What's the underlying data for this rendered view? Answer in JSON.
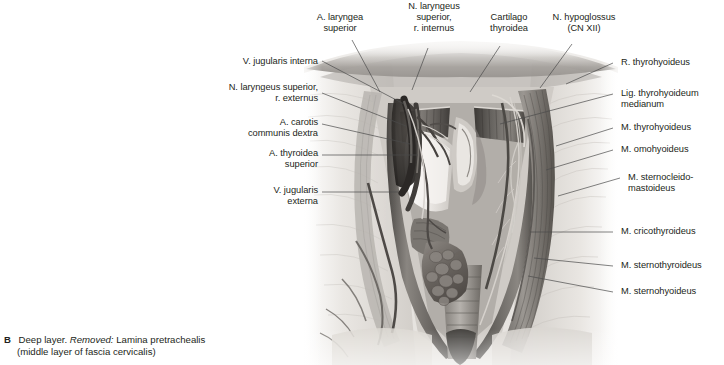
{
  "figure": {
    "panel_letter": "B",
    "caption_lead": "Deep layer.",
    "caption_italic": "Removed:",
    "caption_rest": "Lamina pretrachealis",
    "caption_line2": "(middle layer of fascia cervicalis)"
  },
  "illustration": {
    "alt_name": "anterior-neck-dissection-deep-layer",
    "palette": {
      "ink": "#231f20",
      "leader": "#4a4a4a",
      "muscle_mid": "#8d8a86",
      "muscle_dark": "#4f4c49",
      "fascia_light": "#e3e0dc",
      "vessel_dark": "#3a3735",
      "thyroid": "#6f6a66",
      "background": "#ffffff"
    }
  },
  "labels_top": [
    {
      "id": "a-laryngea-superior",
      "text": "A. laryngea\nsuperior"
    },
    {
      "id": "n-laryngeus-superior-r-internus",
      "text": "N. laryngeus\nsuperior,\nr. internus"
    },
    {
      "id": "cartilago-thyroidea",
      "text": "Cartilago\nthyroidea"
    },
    {
      "id": "n-hypoglossus",
      "text": "N. hypoglossus\n(CN XII)"
    }
  ],
  "labels_left": [
    {
      "id": "v-jugularis-interna",
      "text": "V. jugularis interna"
    },
    {
      "id": "n-laryngeus-superior-r-externus",
      "text": "N. laryngeus superior,\nr. externus"
    },
    {
      "id": "a-carotis-communis-dextra",
      "text": "A. carotis\ncommunis dextra"
    },
    {
      "id": "a-thyroidea-superior",
      "text": "A. thyroidea\nsuperior"
    },
    {
      "id": "v-jugularis-externa",
      "text": "V. jugularis\nexterna"
    }
  ],
  "labels_right": [
    {
      "id": "r-thyrohyoideus",
      "text": "R. thyrohyoideus"
    },
    {
      "id": "lig-thyrohyoideum-medianum",
      "text": "Lig. thyrohyoideum\nmedianum"
    },
    {
      "id": "m-thyrohyoideus",
      "text": "M. thyrohyoideus"
    },
    {
      "id": "m-omohyoideus",
      "text": "M. omohyoideus"
    },
    {
      "id": "m-sternocleidomastoideus",
      "text": "M. sternocleido-\nmastoideus"
    },
    {
      "id": "m-cricothyroideus",
      "text": "M. cricothyroideus"
    },
    {
      "id": "m-sternothyroideus",
      "text": "M. sternothyroideus"
    },
    {
      "id": "m-sternohyoideus",
      "text": "M. sternohyoideus"
    }
  ]
}
